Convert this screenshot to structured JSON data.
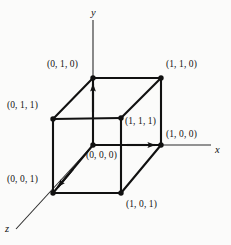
{
  "figure": {
    "background_color": "#fbfbfa",
    "stroke_color": "#111111",
    "axis_color": "#2b2b2b",
    "edge_width_px": 2.1,
    "axis_width_px": 1.1,
    "vertex_dot_radius_px": 2.6
  },
  "axes": [
    {
      "name": "y-axis",
      "label": "y",
      "label_x": 91,
      "label_y": 8,
      "from": [
        93,
        20
      ],
      "to": [
        93,
        145
      ],
      "arrow_at_vertex": true
    },
    {
      "name": "x-axis",
      "label": "x",
      "label_x": 215,
      "label_y": 145,
      "from": [
        93,
        145
      ],
      "to": [
        211,
        145
      ],
      "arrow_at_vertex": true
    },
    {
      "name": "z-axis",
      "label": "z",
      "label_x": 5,
      "label_y": 224,
      "from": [
        93,
        145
      ],
      "to": [
        16,
        229
      ],
      "arrow_at_vertex": true
    }
  ],
  "vertices": [
    {
      "name": "vertex-0-1-0",
      "label": "(0, 1, 0)",
      "px": [
        93,
        78
      ],
      "label_x": 47,
      "label_y": 60
    },
    {
      "name": "vertex-1-1-0",
      "label": "(1, 1, 0)",
      "px": [
        161,
        78
      ],
      "label_x": 166,
      "label_y": 60
    },
    {
      "name": "vertex-0-1-1",
      "label": "(0, 1, 1)",
      "px": [
        53,
        119
      ],
      "label_x": 7,
      "label_y": 101
    },
    {
      "name": "vertex-1-1-1",
      "label": "(1, 1, 1)",
      "px": [
        121,
        118
      ],
      "label_x": 125,
      "label_y": 117
    },
    {
      "name": "vertex-1-0-0",
      "label": "(1, 0, 0)",
      "px": [
        161,
        145
      ],
      "label_x": 166,
      "label_y": 130
    },
    {
      "name": "vertex-0-0-0",
      "label": "(0, 0, 0)",
      "px": [
        93,
        145
      ],
      "label_x": 86,
      "label_y": 151
    },
    {
      "name": "vertex-0-0-1",
      "label": "(0, 0, 1)",
      "px": [
        53,
        193
      ],
      "label_x": 7,
      "label_y": 175
    },
    {
      "name": "vertex-1-0-1",
      "label": "(1, 0, 1)",
      "px": [
        121,
        193
      ],
      "label_x": 126,
      "label_y": 200
    }
  ],
  "edges": [
    {
      "name": "edge-top-back",
      "from": [
        93,
        78
      ],
      "to": [
        161,
        78
      ]
    },
    {
      "name": "edge-top-left",
      "from": [
        93,
        78
      ],
      "to": [
        53,
        119
      ]
    },
    {
      "name": "edge-top-right",
      "from": [
        161,
        78
      ],
      "to": [
        121,
        118
      ]
    },
    {
      "name": "edge-top-front",
      "from": [
        53,
        119
      ],
      "to": [
        121,
        118
      ]
    },
    {
      "name": "edge-back-left",
      "from": [
        93,
        78
      ],
      "to": [
        93,
        145
      ]
    },
    {
      "name": "edge-back-right",
      "from": [
        161,
        78
      ],
      "to": [
        161,
        145
      ]
    },
    {
      "name": "edge-front-left",
      "from": [
        53,
        119
      ],
      "to": [
        53,
        193
      ]
    },
    {
      "name": "edge-front-right",
      "from": [
        121,
        118
      ],
      "to": [
        121,
        193
      ]
    },
    {
      "name": "edge-bot-back",
      "from": [
        93,
        145
      ],
      "to": [
        161,
        145
      ]
    },
    {
      "name": "edge-bot-left",
      "from": [
        93,
        145
      ],
      "to": [
        53,
        193
      ]
    },
    {
      "name": "edge-bot-right",
      "from": [
        161,
        145
      ],
      "to": [
        121,
        193
      ]
    },
    {
      "name": "edge-bot-front",
      "from": [
        53,
        193
      ],
      "to": [
        121,
        193
      ]
    }
  ]
}
